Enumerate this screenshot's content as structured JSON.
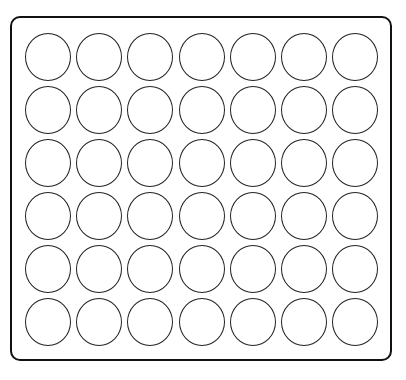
{
  "board": {
    "rows": 6,
    "cols": 7,
    "origin_x": 25,
    "origin_y": 33,
    "col_pitch": 51.2,
    "row_pitch": 53,
    "cell_width": 46,
    "cell_height": 48,
    "frame_color": "#111111",
    "cell_stroke_color": "#222222",
    "cell_fill_color": "#ffffff",
    "cells": [
      [
        "empty",
        "empty",
        "empty",
        "empty",
        "empty",
        "empty",
        "empty"
      ],
      [
        "empty",
        "empty",
        "empty",
        "empty",
        "empty",
        "empty",
        "empty"
      ],
      [
        "empty",
        "empty",
        "empty",
        "empty",
        "empty",
        "empty",
        "empty"
      ],
      [
        "empty",
        "empty",
        "empty",
        "empty",
        "empty",
        "empty",
        "empty"
      ],
      [
        "empty",
        "empty",
        "empty",
        "empty",
        "empty",
        "empty",
        "empty"
      ],
      [
        "empty",
        "empty",
        "empty",
        "empty",
        "empty",
        "empty",
        "empty"
      ]
    ]
  }
}
